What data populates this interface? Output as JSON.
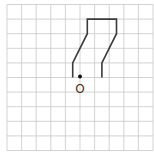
{
  "figure": {
    "type": "grid-diagram",
    "grid": {
      "origin_x": 7,
      "origin_y": 4.5,
      "cell": 14.6,
      "cols": 10,
      "rows": 10,
      "color": "#c8c8c8"
    },
    "shape": {
      "color": "#3a3a3a",
      "points_grid": [
        [
          4.5,
          5
        ],
        [
          4.5,
          4
        ],
        [
          5.5,
          2
        ],
        [
          5.5,
          1
        ],
        [
          7.5,
          1
        ],
        [
          7.5,
          2
        ],
        [
          6.5,
          4
        ],
        [
          6.5,
          5
        ]
      ]
    },
    "point": {
      "label": "O",
      "grid_x": 5,
      "grid_y": 5
    }
  }
}
